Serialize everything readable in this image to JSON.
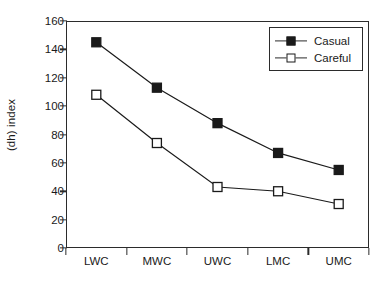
{
  "chart_data": {
    "type": "line",
    "title": "",
    "xlabel": "",
    "ylabel": "(dh) index",
    "categories": [
      "LWC",
      "MWC",
      "UWC",
      "LMC",
      "UMC"
    ],
    "ylim": [
      0,
      160
    ],
    "ytick_step": 20,
    "yticks": [
      0,
      20,
      40,
      60,
      80,
      100,
      120,
      140,
      160
    ],
    "grid": false,
    "legend_position": "top-right",
    "series": [
      {
        "name": "Casual",
        "marker": "filled-square",
        "color": "#1a1a1a",
        "values": [
          145,
          113,
          88,
          67,
          55
        ]
      },
      {
        "name": "Careful",
        "marker": "open-square",
        "color": "#1a1a1a",
        "values": [
          108,
          74,
          43,
          40,
          31
        ]
      }
    ]
  },
  "legend": {
    "items": [
      {
        "label": "Casual"
      },
      {
        "label": "Careful"
      }
    ]
  },
  "axes": {
    "y_title": "(dh) index",
    "y_labels": [
      "160",
      "140",
      "120",
      "100",
      "80",
      "60",
      "40",
      "20",
      "0"
    ],
    "x_labels": [
      "LWC",
      "MWC",
      "UWC",
      "LMC",
      "UMC"
    ]
  }
}
